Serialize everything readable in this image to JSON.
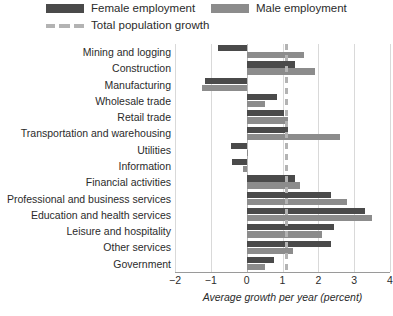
{
  "legend": {
    "female": "Female employment",
    "male": "Male employment",
    "total": "Total population growth"
  },
  "colors": {
    "female": "#4a4a4a",
    "male": "#8c8c8c",
    "reference_line": "#b3b3b3",
    "grid": "#d9d9d9",
    "background": "#ffffff"
  },
  "chart_data": {
    "type": "bar",
    "orientation": "horizontal",
    "title": "",
    "subtitle": "",
    "xlabel": "Average growth per year (percent)",
    "ylabel": "",
    "xlim": [
      -2,
      4
    ],
    "xticks": [
      -2,
      -1,
      0,
      1,
      2,
      3,
      4
    ],
    "xticklabels": [
      "−2",
      "−1",
      "0",
      "1",
      "2",
      "3",
      "4"
    ],
    "grid": true,
    "legend_position": "top-left",
    "categories": [
      "Mining and logging",
      "Construction",
      "Manufacturing",
      "Wholesale trade",
      "Retail trade",
      "Transportation and warehousing",
      "Utilities",
      "Information",
      "Financial activities",
      "Professional and business services",
      "Education and health services",
      "Leisure and hospitality",
      "Other services",
      "Government"
    ],
    "series": [
      {
        "name": "Female employment",
        "color": "#4a4a4a",
        "values": [
          -0.8,
          1.35,
          -1.15,
          0.85,
          1.05,
          1.15,
          -0.45,
          -0.4,
          1.35,
          2.35,
          3.3,
          2.45,
          2.35,
          0.75
        ]
      },
      {
        "name": "Male employment",
        "color": "#8c8c8c",
        "values": [
          1.6,
          1.9,
          -1.25,
          0.5,
          1.15,
          2.6,
          0.05,
          -0.1,
          1.5,
          2.8,
          3.5,
          2.1,
          1.3,
          0.5
        ]
      }
    ],
    "reference_line": {
      "name": "Total population growth",
      "value": 1.1,
      "style": "dashed",
      "color": "#b3b3b3"
    }
  }
}
